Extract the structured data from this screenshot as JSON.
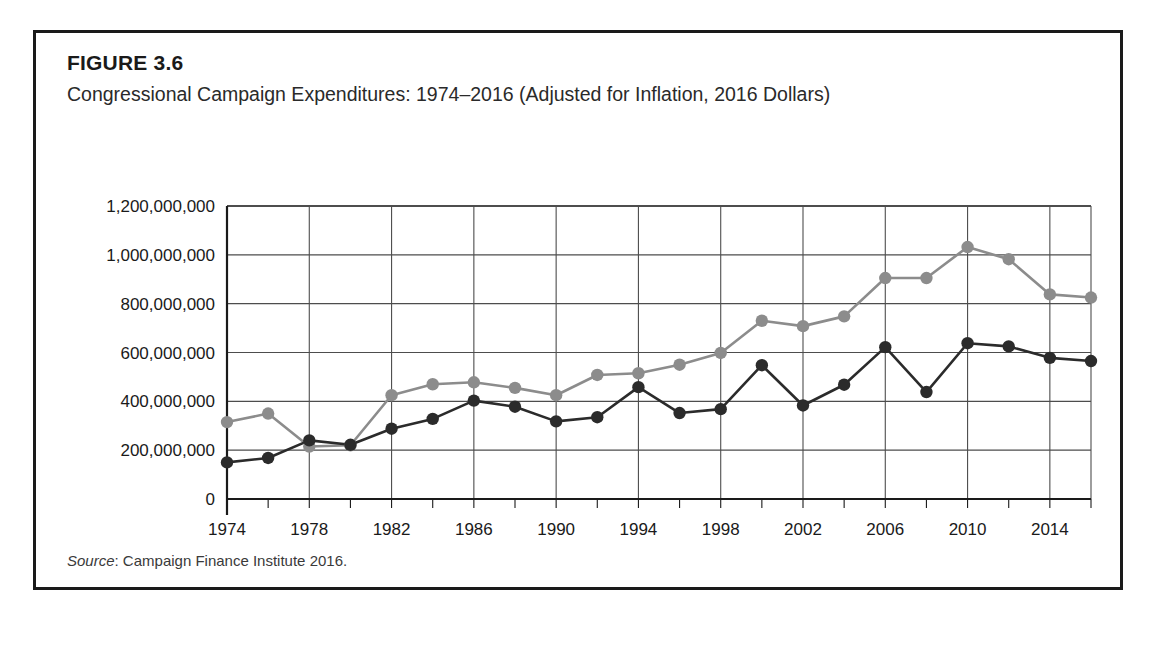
{
  "figure": {
    "title": "FIGURE 3.6",
    "subtitle": "Congressional Campaign Expenditures: 1974–2016 (Adjusted for Inflation, 2016 Dollars)",
    "source_label": "Source",
    "source_text": ": Campaign Finance Institute 2016."
  },
  "colors": {
    "house": "#8c8c8c",
    "senate": "#2b2b2b",
    "axis": "#1a1a1a",
    "grid": "#4d4d4d",
    "frame": "#1a1a1a",
    "background": "#ffffff"
  },
  "chart_data": {
    "type": "line",
    "title": "Congressional Campaign Expenditures: 1974–2016 (Adjusted for Inflation, 2016 Dollars)",
    "xlabel": "",
    "ylabel": "",
    "x": [
      1974,
      1976,
      1978,
      1980,
      1982,
      1984,
      1986,
      1988,
      1990,
      1992,
      1994,
      1996,
      1998,
      2000,
      2002,
      2004,
      2006,
      2008,
      2010,
      2012,
      2014,
      2016
    ],
    "xlim": [
      1974,
      2016
    ],
    "ylim": [
      0,
      1200000000
    ],
    "ytick_values": [
      0,
      200000000,
      400000000,
      600000000,
      800000000,
      1000000000,
      1200000000
    ],
    "ytick_labels": [
      "0",
      "200,000,000",
      "400,000,000",
      "600,000,000",
      "800,000,000",
      "1,000,000,000",
      "1,200,000,000"
    ],
    "xtick_values": [
      1974,
      1978,
      1982,
      1986,
      1990,
      1994,
      1998,
      2002,
      2006,
      2010,
      2014
    ],
    "xtick_labels": [
      "1974",
      "1978",
      "1982",
      "1986",
      "1990",
      "1994",
      "1998",
      "2002",
      "2006",
      "2010",
      "2014"
    ],
    "grid": true,
    "legend_position": "bottom",
    "series": [
      {
        "name": "House Campaign",
        "color": "#8c8c8c",
        "values": [
          315000000,
          350000000,
          215000000,
          220000000,
          425000000,
          470000000,
          478000000,
          455000000,
          425000000,
          508000000,
          515000000,
          550000000,
          598000000,
          730000000,
          708000000,
          748000000,
          905000000,
          905000000,
          1032000000,
          982000000,
          838000000,
          825000000
        ]
      },
      {
        "name": "Senate Campaign",
        "color": "#2b2b2b",
        "values": [
          150000000,
          168000000,
          240000000,
          222000000,
          288000000,
          328000000,
          403000000,
          378000000,
          318000000,
          335000000,
          458000000,
          352000000,
          368000000,
          548000000,
          383000000,
          468000000,
          622000000,
          438000000,
          638000000,
          625000000,
          578000000,
          565000000
        ]
      }
    ]
  }
}
